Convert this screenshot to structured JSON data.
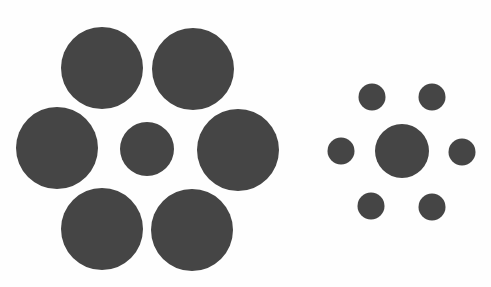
{
  "figure": {
    "background": "#fefefe",
    "fill": "#454545",
    "groups": [
      {
        "name": "left-group",
        "description": "small center circle surrounded by large circles",
        "center": {
          "cx": 147,
          "cy": 149,
          "r": 27
        },
        "surround": [
          {
            "cx": 102,
            "cy": 68,
            "r": 41
          },
          {
            "cx": 193,
            "cy": 69,
            "r": 41
          },
          {
            "cx": 57,
            "cy": 148,
            "r": 41
          },
          {
            "cx": 238,
            "cy": 150,
            "r": 41
          },
          {
            "cx": 102,
            "cy": 229,
            "r": 41
          },
          {
            "cx": 192,
            "cy": 230,
            "r": 41
          }
        ]
      },
      {
        "name": "right-group",
        "description": "center circle surrounded by small circles",
        "center": {
          "cx": 402,
          "cy": 151,
          "r": 27
        },
        "surround": [
          {
            "cx": 372,
            "cy": 97,
            "r": 13.5
          },
          {
            "cx": 432,
            "cy": 97,
            "r": 13.5
          },
          {
            "cx": 341,
            "cy": 151,
            "r": 13.5
          },
          {
            "cx": 462,
            "cy": 152,
            "r": 13.5
          },
          {
            "cx": 371,
            "cy": 206,
            "r": 13.5
          },
          {
            "cx": 432,
            "cy": 207,
            "r": 13.5
          }
        ]
      }
    ]
  }
}
